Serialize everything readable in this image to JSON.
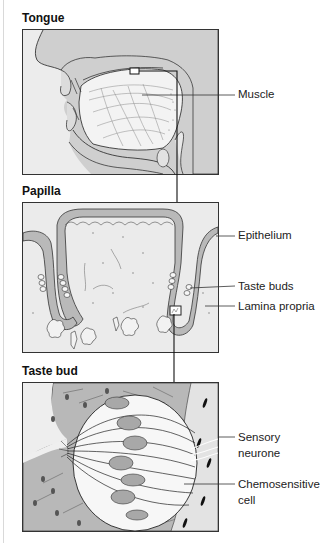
{
  "panels": [
    {
      "title": "Tongue",
      "labels": [
        "Muscle"
      ]
    },
    {
      "title": "Papilla",
      "labels": [
        "Epithelium",
        "Taste buds",
        "Lamina propria"
      ]
    },
    {
      "title": "Taste bud",
      "labels": [
        "Sensory neurone",
        "Chemosensitive cell"
      ]
    }
  ],
  "tongue": {
    "title": "Tongue",
    "label_muscle": "Muscle"
  },
  "papilla": {
    "title": "Papilla",
    "label_epithelium": "Epithelium",
    "label_taste_buds": "Taste buds",
    "label_lamina": "Lamina propria"
  },
  "tastebud": {
    "title": "Taste bud",
    "label_sensory_1": "Sensory",
    "label_sensory_2": "neurone",
    "label_chemo_1": "Chemosensitive",
    "label_chemo_2": "cell"
  },
  "colors": {
    "background": "#ffffff",
    "panel_fill": "#e6e6e6",
    "tissue_dark": "#b0b0b0",
    "tissue_mid": "#c8c8c8",
    "tissue_light": "#f2f2f2",
    "line": "#222222"
  }
}
